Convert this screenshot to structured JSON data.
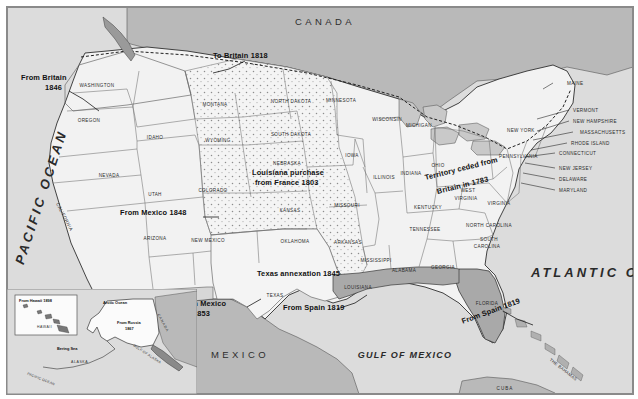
{
  "map": {
    "title": "Territorial acquisitions of the United States",
    "colors": {
      "land_us": "#f2f2f2",
      "land_foreign": "#b8b8b8",
      "water": "#dcdcdc",
      "acquired_spain": "#a9a9a9",
      "border": "#3a3a3a"
    },
    "countries": [
      {
        "name": "CANADA",
        "x": 318,
        "y": 14
      },
      {
        "name": "MEXICO",
        "x": 233,
        "y": 347
      }
    ],
    "oceans": [
      {
        "name": "PACIFIC OCEAN",
        "x": 34,
        "y": 190,
        "size": 13,
        "rotate": -72
      },
      {
        "name": "ATLANTIC OCEAN",
        "x": 560,
        "y": 272,
        "size": 13,
        "rotate": 0
      },
      {
        "name": "GULF OF MEXICO",
        "x": 398,
        "y": 348,
        "size": 9,
        "rotate": 0
      }
    ],
    "acquisitions": [
      {
        "label": "To Britain 1818",
        "x": 206,
        "y": 48
      },
      {
        "label": "From Britain",
        "x": 14,
        "y": 70
      },
      {
        "label": "1846",
        "x": 38,
        "y": 79
      },
      {
        "label": "Louisiana purchase",
        "x": 245,
        "y": 165
      },
      {
        "label": "from France 1803",
        "x": 248,
        "y": 175
      },
      {
        "label": "Territory ceded from",
        "x": 425,
        "y": 172
      },
      {
        "label": "Britain in 1783",
        "x": 438,
        "y": 184
      },
      {
        "label": "From Mexico 1848",
        "x": 113,
        "y": 205
      },
      {
        "label": "Texas annexation 1845",
        "x": 250,
        "y": 266
      },
      {
        "label": "From Mexico",
        "x": 178,
        "y": 296
      },
      {
        "label": "1853",
        "x": 193,
        "y": 307
      },
      {
        "label": "From Spain 1819",
        "x": 281,
        "y": 300
      },
      {
        "label": "From Spain 1819",
        "x": 465,
        "y": 317
      }
    ],
    "states": [
      {
        "name": "WASHINGTON",
        "x": 90,
        "y": 78
      },
      {
        "name": "OREGON",
        "x": 82,
        "y": 113
      },
      {
        "name": "IDAHO",
        "x": 148,
        "y": 130
      },
      {
        "name": "MONTANA",
        "x": 208,
        "y": 97
      },
      {
        "name": "NORTH DAKOTA",
        "x": 284,
        "y": 94
      },
      {
        "name": "SOUTH DAKOTA",
        "x": 284,
        "y": 127
      },
      {
        "name": "MINNESOTA",
        "x": 334,
        "y": 93
      },
      {
        "name": "WISCONSIN",
        "x": 380,
        "y": 112
      },
      {
        "name": "MICHIGAN",
        "x": 412,
        "y": 118
      },
      {
        "name": "WYOMING",
        "x": 211,
        "y": 133
      },
      {
        "name": "NEBRASKA",
        "x": 280,
        "y": 156
      },
      {
        "name": "IOWA",
        "x": 345,
        "y": 148
      },
      {
        "name": "ILLINOIS",
        "x": 377,
        "y": 170
      },
      {
        "name": "INDIANA",
        "x": 404,
        "y": 166
      },
      {
        "name": "OHIO",
        "x": 431,
        "y": 158
      },
      {
        "name": "NEVADA",
        "x": 102,
        "y": 168
      },
      {
        "name": "UTAH",
        "x": 148,
        "y": 187
      },
      {
        "name": "COLORADO",
        "x": 206,
        "y": 183
      },
      {
        "name": "KANSAS",
        "x": 283,
        "y": 203
      },
      {
        "name": "MISSOURI",
        "x": 340,
        "y": 198
      },
      {
        "name": "KENTUCKY",
        "x": 421,
        "y": 200
      },
      {
        "name": "TENNESSEE",
        "x": 418,
        "y": 222
      },
      {
        "name": "WEST",
        "x": 461,
        "y": 183
      },
      {
        "name": "VIRGINIA",
        "x": 459,
        "y": 191
      },
      {
        "name": "VIRGINIA",
        "x": 492,
        "y": 196
      },
      {
        "name": "NORTH CAROLINA",
        "x": 482,
        "y": 218
      },
      {
        "name": "SOUTH",
        "x": 482,
        "y": 232
      },
      {
        "name": "CAROLINA",
        "x": 480,
        "y": 239
      },
      {
        "name": "CALIFORNIA",
        "x": 66,
        "y": 196,
        "rotate": 63
      },
      {
        "name": "ARIZONA",
        "x": 148,
        "y": 231
      },
      {
        "name": "NEW MEXICO",
        "x": 201,
        "y": 233
      },
      {
        "name": "OKLAHOMA",
        "x": 288,
        "y": 234
      },
      {
        "name": "ARKANSAS",
        "x": 341,
        "y": 235
      },
      {
        "name": "MISSISSIPPI",
        "x": 369,
        "y": 253
      },
      {
        "name": "ALABAMA",
        "x": 397,
        "y": 263
      },
      {
        "name": "GEORGIA",
        "x": 436,
        "y": 260
      },
      {
        "name": "TEXAS",
        "x": 268,
        "y": 288
      },
      {
        "name": "LOUISIANA",
        "x": 351,
        "y": 280
      },
      {
        "name": "FLORIDA",
        "x": 480,
        "y": 296
      }
    ],
    "callout_states": [
      {
        "name": "MAINE",
        "x": 560,
        "y": 74
      },
      {
        "name": "VERMONT",
        "x": 566,
        "y": 101
      },
      {
        "name": "NEW HAMPSHIRE",
        "x": 566,
        "y": 112
      },
      {
        "name": "MASSACHUSETTS",
        "x": 573,
        "y": 123
      },
      {
        "name": "RHODE ISLAND",
        "x": 564,
        "y": 134
      },
      {
        "name": "CONNECTICUT",
        "x": 552,
        "y": 144
      },
      {
        "name": "NEW JERSEY",
        "x": 552,
        "y": 159
      },
      {
        "name": "DELAWARE",
        "x": 552,
        "y": 170
      },
      {
        "name": "MARYLAND",
        "x": 552,
        "y": 181
      },
      {
        "name": "NEW YORK",
        "x": 500,
        "y": 121
      },
      {
        "name": "PENNSYLVANIA",
        "x": 492,
        "y": 147
      }
    ],
    "islands": [
      {
        "name": "THE BAHAMAS",
        "x": 560,
        "y": 352,
        "rotate": 38
      },
      {
        "name": "CUBA",
        "x": 498,
        "y": 385
      }
    ],
    "inset": {
      "alaska": {
        "labels": [
          {
            "name": "From Russia",
            "x": 122,
            "y": 317,
            "bold": true
          },
          {
            "name": "1867",
            "x": 129,
            "y": 322,
            "bold": true
          },
          {
            "name": "Arctic Ocean",
            "x": 113,
            "y": 297,
            "bold": true
          },
          {
            "name": "CANADA",
            "x": 156,
            "y": 316,
            "rotate": 62
          },
          {
            "name": "ALASKA",
            "x": 80,
            "y": 356
          },
          {
            "name": "Bering Sea",
            "x": 65,
            "y": 342,
            "bold": true
          },
          {
            "name": "GULF OF ALASKA",
            "x": 140,
            "y": 347,
            "rotate": 33
          },
          {
            "name": "PACIFIC OCEAN",
            "x": 30,
            "y": 372,
            "rotate": 22
          }
        ]
      },
      "hawaii": {
        "title": "From Hawaii 1898",
        "label": "HAWAII",
        "x": 8,
        "y": 288,
        "w": 62,
        "h": 40
      }
    }
  }
}
